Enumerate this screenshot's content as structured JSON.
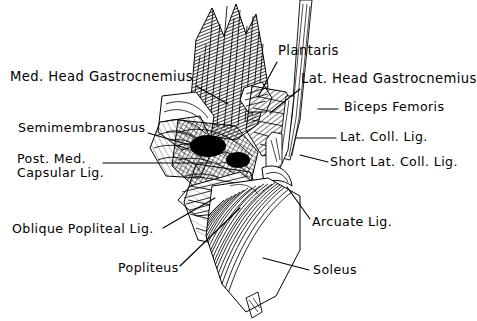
{
  "figure": {
    "style": "pen-and-ink line drawing, black on white",
    "background_color": "#ffffff",
    "ink_color": "#000000",
    "width": 477,
    "height": 321
  },
  "labels": [
    {
      "id": "med-head-gastrocnemius",
      "text": "Med. Head  Gastrocnemius",
      "x": 10,
      "y": 70,
      "size": "lbl-lg",
      "leader": {
        "x1": 196,
        "y1": 86,
        "x2": 228,
        "y2": 104
      }
    },
    {
      "id": "plantaris",
      "text": "Plantaris",
      "x": 278,
      "y": 44,
      "size": "lbl-lg",
      "leader": {
        "x1": 277,
        "y1": 62,
        "x2": 258,
        "y2": 97
      }
    },
    {
      "id": "lat-head-gastrocnemius",
      "text": "Lat. Head  Gastrocnemius",
      "x": 301,
      "y": 72,
      "size": "lbl-lg",
      "leader": {
        "x1": 300,
        "y1": 89,
        "x2": 270,
        "y2": 113
      }
    },
    {
      "id": "biceps-femoris",
      "text": "Biceps Femoris",
      "x": 344,
      "y": 100,
      "size": "lbl-md",
      "leader": {
        "x1": 338,
        "y1": 109,
        "x2": 318,
        "y2": 109
      }
    },
    {
      "id": "semimembranosus",
      "text": "Semimembranosus",
      "x": 18,
      "y": 121,
      "size": "lbl-md",
      "leader": {
        "x1": 148,
        "y1": 133,
        "x2": 214,
        "y2": 152
      }
    },
    {
      "id": "lat-coll-lig",
      "text": "Lat. Coll. Lig.",
      "x": 340,
      "y": 130,
      "size": "lbl-md",
      "leader": {
        "x1": 336,
        "y1": 138,
        "x2": 296,
        "y2": 138
      }
    },
    {
      "id": "post-med-capsular-lig",
      "text": "Post. Med.\nCapsular Lig.",
      "x": 17,
      "y": 152,
      "size": "lbl-md",
      "leader": {
        "x1": 103,
        "y1": 163,
        "x2": 212,
        "y2": 163
      }
    },
    {
      "id": "short-lat-coll-lig",
      "text": "Short Lat. Coll. Lig.",
      "x": 330,
      "y": 155,
      "size": "lbl-md",
      "leader": {
        "x1": 328,
        "y1": 162,
        "x2": 300,
        "y2": 155
      }
    },
    {
      "id": "oblique-popliteal-lig",
      "text": "Oblique  Popliteal  Lig.",
      "x": 12,
      "y": 222,
      "size": "lbl-md",
      "leader": {
        "x1": 163,
        "y1": 228,
        "x2": 215,
        "y2": 198
      }
    },
    {
      "id": "arcuate-lig",
      "text": "Arcuate Lig.",
      "x": 312,
      "y": 215,
      "size": "lbl-md",
      "leader": {
        "x1": 310,
        "y1": 219,
        "x2": 287,
        "y2": 187
      }
    },
    {
      "id": "popliteus",
      "text": "Popliteus",
      "x": 118,
      "y": 261,
      "size": "lbl-md",
      "leader": {
        "x1": 180,
        "y1": 266,
        "x2": 240,
        "y2": 208
      }
    },
    {
      "id": "soleus",
      "text": "Soleus",
      "x": 313,
      "y": 263,
      "size": "lbl-md",
      "leader": {
        "x1": 309,
        "y1": 270,
        "x2": 263,
        "y2": 258
      }
    }
  ]
}
